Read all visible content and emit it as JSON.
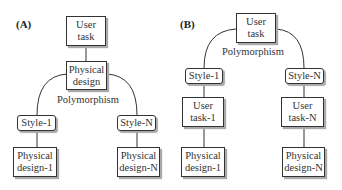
{
  "panel_a": {
    "label": "(A)",
    "user_task": "User task",
    "physical_design": "Physical design",
    "polymorphism": "Polymorphism",
    "style_1": "Style-1",
    "style_n": "Style-N",
    "physical_design_1": "Physical design-1",
    "physical_design_n": "Physical design-N"
  },
  "panel_b": {
    "label": "(B)",
    "user_task": "User task",
    "polymorphism": "Polymorphism",
    "style_1": "Style-1",
    "style_n": "Style-N",
    "user_task_1": "User task-1",
    "user_task_n": "User task-N",
    "physical_design_1": "Physical design-1",
    "physical_design_n": "Physical design-N"
  }
}
